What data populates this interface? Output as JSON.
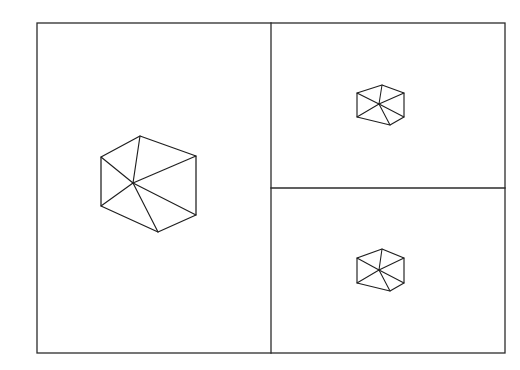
{
  "figure": {
    "title": "",
    "caption": "",
    "background_color": "#ffffff",
    "line_color": "#1f1f1f",
    "frame_color": "#2b2b2b",
    "width": 520,
    "height": 370
  },
  "frame": {
    "name": "outer-frame",
    "x": 37,
    "y": 23,
    "width": 468,
    "height": 330
  },
  "dividers": [
    {
      "name": "vertical-divider",
      "orientation": "vertical",
      "x": 271,
      "y1": 23,
      "y2": 353
    },
    {
      "name": "horizontal-divider",
      "orientation": "horizontal",
      "y": 188,
      "x1": 271,
      "x2": 505
    }
  ],
  "panels": [
    {
      "id": "panel-left",
      "label": "",
      "x": 37,
      "y": 23,
      "width": 234,
      "height": 330,
      "cube": "cube-large"
    },
    {
      "id": "panel-top-right",
      "label": "",
      "x": 271,
      "y": 23,
      "width": 234,
      "height": 165,
      "cube": "cube-small-top"
    },
    {
      "id": "panel-bottom-right",
      "label": "",
      "x": 271,
      "y": 188,
      "width": 234,
      "height": 165,
      "cube": "cube-small-bottom"
    }
  ],
  "cubes": [
    {
      "id": "cube-large",
      "name": "isometric-cube-large",
      "panel": "panel-left",
      "size": "large",
      "center": {
        "x": 133,
        "y": 183
      },
      "outline_points": "140,136 196,156 196,215 158,232 101,206 101,157",
      "spokes": [
        {
          "from": {
            "x": 133,
            "y": 183
          },
          "to": {
            "x": 140,
            "y": 136
          }
        },
        {
          "from": {
            "x": 133,
            "y": 183
          },
          "to": {
            "x": 101,
            "y": 157
          }
        },
        {
          "from": {
            "x": 133,
            "y": 183
          },
          "to": {
            "x": 101,
            "y": 206
          }
        },
        {
          "from": {
            "x": 133,
            "y": 183
          },
          "to": {
            "x": 196,
            "y": 156
          }
        },
        {
          "from": {
            "x": 133,
            "y": 183
          },
          "to": {
            "x": 158,
            "y": 232
          }
        },
        {
          "from": {
            "x": 133,
            "y": 183
          },
          "to": {
            "x": 196,
            "y": 215
          }
        }
      ]
    },
    {
      "id": "cube-small-top",
      "name": "isometric-cube-small-top",
      "panel": "panel-top-right",
      "size": "small",
      "center": {
        "x": 379,
        "y": 104
      },
      "outline_points": "382,85 404,93 404,117 390,125 357,117 357,93",
      "spokes": [
        {
          "from": {
            "x": 379,
            "y": 104
          },
          "to": {
            "x": 382,
            "y": 85
          }
        },
        {
          "from": {
            "x": 379,
            "y": 104
          },
          "to": {
            "x": 357,
            "y": 93
          }
        },
        {
          "from": {
            "x": 379,
            "y": 104
          },
          "to": {
            "x": 357,
            "y": 117
          }
        },
        {
          "from": {
            "x": 379,
            "y": 104
          },
          "to": {
            "x": 404,
            "y": 93
          }
        },
        {
          "from": {
            "x": 379,
            "y": 104
          },
          "to": {
            "x": 390,
            "y": 125
          }
        },
        {
          "from": {
            "x": 379,
            "y": 104
          },
          "to": {
            "x": 404,
            "y": 117
          }
        }
      ]
    },
    {
      "id": "cube-small-bottom",
      "name": "isometric-cube-small-bottom",
      "panel": "panel-bottom-right",
      "size": "small",
      "center": {
        "x": 379,
        "y": 270
      },
      "outline_points": "382,249 404,258 404,283 390,291 357,283 357,258",
      "spokes": [
        {
          "from": {
            "x": 379,
            "y": 270
          },
          "to": {
            "x": 382,
            "y": 249
          }
        },
        {
          "from": {
            "x": 379,
            "y": 270
          },
          "to": {
            "x": 357,
            "y": 258
          }
        },
        {
          "from": {
            "x": 379,
            "y": 270
          },
          "to": {
            "x": 357,
            "y": 283
          }
        },
        {
          "from": {
            "x": 379,
            "y": 270
          },
          "to": {
            "x": 404,
            "y": 258
          }
        },
        {
          "from": {
            "x": 379,
            "y": 270
          },
          "to": {
            "x": 390,
            "y": 291
          }
        },
        {
          "from": {
            "x": 379,
            "y": 270
          },
          "to": {
            "x": 404,
            "y": 283
          }
        }
      ]
    }
  ]
}
